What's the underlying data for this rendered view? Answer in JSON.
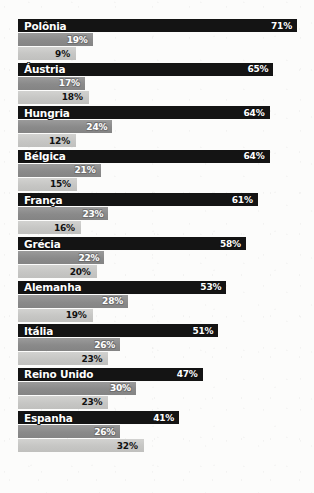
{
  "chart_data": {
    "type": "bar",
    "title": "",
    "subtitle": "",
    "xlabel": "",
    "ylabel": "",
    "orientation": "horizontal",
    "grouped": true,
    "grid": false,
    "legend": "none",
    "xlim": [
      0,
      71
    ],
    "value_suffix": "%",
    "categories": [
      "Polônia",
      "Áustria",
      "Hungria",
      "Bélgica",
      "França",
      "Grécia",
      "Alemanha",
      "Itália",
      "Reino Unido",
      "Espanha"
    ],
    "series": [
      {
        "name": "series-1",
        "color": "#141414",
        "values": [
          71,
          65,
          64,
          64,
          61,
          58,
          53,
          51,
          47,
          41
        ],
        "labels": [
          "71%",
          "65%",
          "64%",
          "64%",
          "61%",
          "58%",
          "53%",
          "51%",
          "47%",
          "41%"
        ]
      },
      {
        "name": "series-2",
        "color": "#8f8f8f",
        "values": [
          19,
          17,
          24,
          21,
          23,
          22,
          28,
          26,
          30,
          26
        ],
        "labels": [
          "19%",
          "17%",
          "24%",
          "21%",
          "23%",
          "22%",
          "28%",
          "26%",
          "30%",
          "26%"
        ]
      },
      {
        "name": "series-3",
        "color": "#c9c9c7",
        "values": [
          9,
          18,
          12,
          15,
          16,
          20,
          19,
          23,
          23,
          32
        ],
        "labels": [
          "9%",
          "18%",
          "12%",
          "15%",
          "16%",
          "20%",
          "19%",
          "23%",
          "23%",
          "32%"
        ]
      }
    ]
  },
  "groups": [
    {
      "country": "Polônia",
      "b1": {
        "value": 71,
        "label": "71%"
      },
      "b2": {
        "value": 19,
        "label": "19%"
      },
      "b3": {
        "value": 9,
        "label": "9%"
      }
    },
    {
      "country": "Áustria",
      "b1": {
        "value": 65,
        "label": "65%"
      },
      "b2": {
        "value": 17,
        "label": "17%"
      },
      "b3": {
        "value": 18,
        "label": "18%"
      }
    },
    {
      "country": "Hungria",
      "b1": {
        "value": 64,
        "label": "64%"
      },
      "b2": {
        "value": 24,
        "label": "24%"
      },
      "b3": {
        "value": 12,
        "label": "12%"
      }
    },
    {
      "country": "Bélgica",
      "b1": {
        "value": 64,
        "label": "64%"
      },
      "b2": {
        "value": 21,
        "label": "21%"
      },
      "b3": {
        "value": 15,
        "label": "15%"
      }
    },
    {
      "country": "França",
      "b1": {
        "value": 61,
        "label": "61%"
      },
      "b2": {
        "value": 23,
        "label": "23%"
      },
      "b3": {
        "value": 16,
        "label": "16%"
      }
    },
    {
      "country": "Grécia",
      "b1": {
        "value": 58,
        "label": "58%"
      },
      "b2": {
        "value": 22,
        "label": "22%"
      },
      "b3": {
        "value": 20,
        "label": "20%"
      }
    },
    {
      "country": "Alemanha",
      "b1": {
        "value": 53,
        "label": "53%"
      },
      "b2": {
        "value": 28,
        "label": "28%"
      },
      "b3": {
        "value": 19,
        "label": "19%"
      }
    },
    {
      "country": "Itália",
      "b1": {
        "value": 51,
        "label": "51%"
      },
      "b2": {
        "value": 26,
        "label": "26%"
      },
      "b3": {
        "value": 23,
        "label": "23%"
      }
    },
    {
      "country": "Reino Unido",
      "b1": {
        "value": 47,
        "label": "47%"
      },
      "b2": {
        "value": 30,
        "label": "30%"
      },
      "b3": {
        "value": 23,
        "label": "23%"
      }
    },
    {
      "country": "Espanha",
      "b1": {
        "value": 41,
        "label": "41%"
      },
      "b2": {
        "value": 26,
        "label": "26%"
      },
      "b3": {
        "value": 32,
        "label": "32%"
      }
    }
  ],
  "layout": {
    "px_per_percent": 3.93,
    "min_bar_px": 58,
    "group_top": 19,
    "group_pitch": 43.6
  }
}
